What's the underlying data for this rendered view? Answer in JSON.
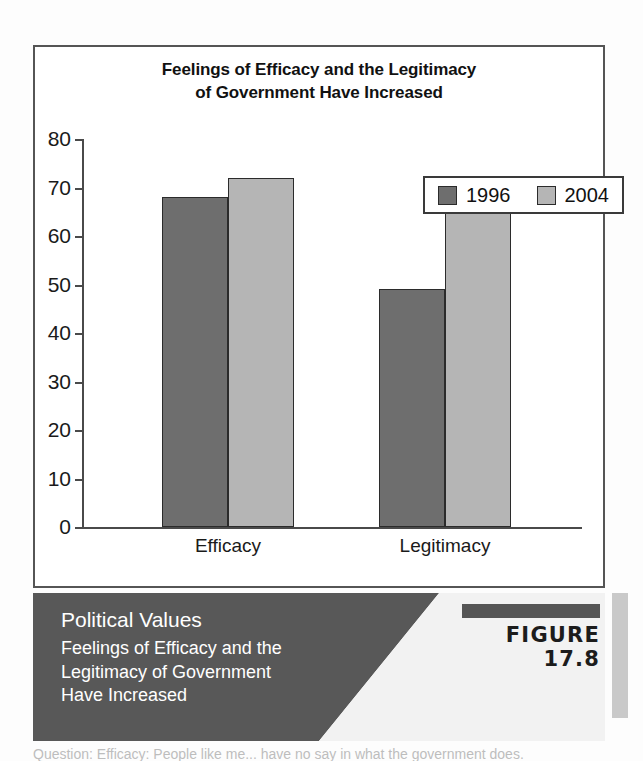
{
  "chart_data": {
    "type": "bar",
    "title": "Feelings of Efficacy and the Legitimacy of Government Have Increased",
    "title_line1": "Feelings of Efficacy and the Legitimacy",
    "title_line2": "of Government Have Increased",
    "categories": [
      "Efficacy",
      "Legitimacy"
    ],
    "series": [
      {
        "name": "1996",
        "values": [
          68,
          49
        ],
        "color": "#6e6e6e"
      },
      {
        "name": "2004",
        "values": [
          72,
          68
        ],
        "color": "#b5b5b5"
      }
    ],
    "xlabel": "",
    "ylabel": "",
    "ylim": [
      0,
      80
    ],
    "yticks": [
      0,
      10,
      20,
      30,
      40,
      50,
      60,
      70,
      80
    ],
    "ytick_labels": [
      "0",
      "10",
      "20",
      "30",
      "40",
      "50",
      "60",
      "70",
      "80"
    ],
    "grid": false,
    "legend_position": "top-right"
  },
  "caption": {
    "heading": "Political Values",
    "subtitle_line1": "Feelings of Efficacy and the",
    "subtitle_line2": "Legitimacy of Government",
    "subtitle_line3": "Have Increased",
    "figure_label": "FIGURE 17.8"
  },
  "colors": {
    "series_1996": "#6e6e6e",
    "series_2004": "#b5b5b5",
    "caption_band_dark": "#585858",
    "caption_band_light": "#f2f2f2",
    "axis": "#4a4a4a"
  },
  "bottom_text": "Question: Efficacy: People like me...  have no say in what the government does."
}
